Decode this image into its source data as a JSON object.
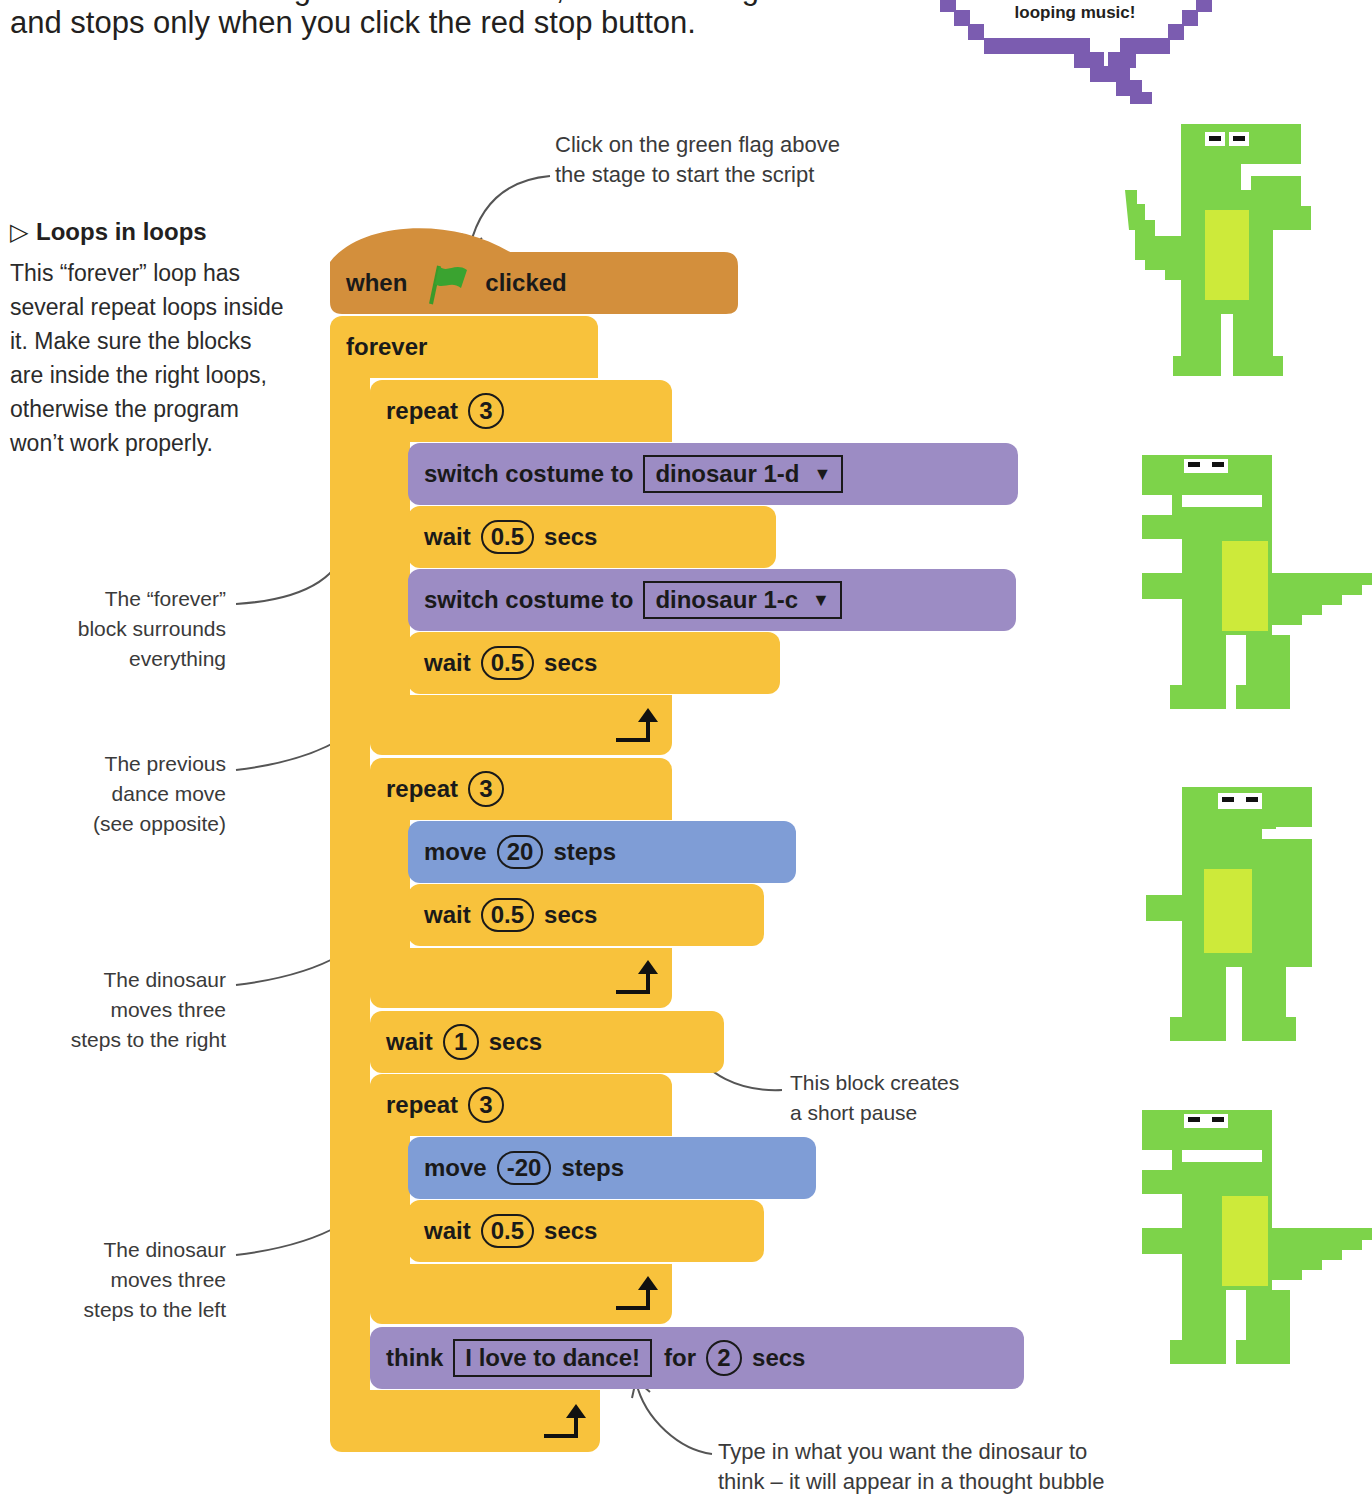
{
  "intro": {
    "line1": "moment. When he’s got his breath back, he dances again",
    "line2": "and stops only when you click the red stop button."
  },
  "speech_bubble": {
    "text": "looping music!",
    "color": "#7b5cb0"
  },
  "sidebar": {
    "title_icon": "triangle-right-icon",
    "title": "Loops in loops",
    "body": "This “forever” loop has several repeat loops inside it. Make sure the blocks are inside the right loops, otherwise the program won’t work properly."
  },
  "annotations": {
    "green_flag": [
      "Click on the green flag above",
      "the stage to start the script"
    ],
    "forever": [
      "The “forever”",
      "block surrounds",
      "everything"
    ],
    "previous": [
      "The previous",
      "dance move",
      "(see opposite)"
    ],
    "right": [
      "The dinosaur",
      "moves three",
      "steps to the right"
    ],
    "left": [
      "The dinosaur",
      "moves three",
      "steps to the left"
    ],
    "pause": [
      "This block creates",
      "a short pause"
    ],
    "think": [
      "Type in what you want the dinosaur to",
      "think – it will appear in a thought bubble"
    ]
  },
  "script": {
    "hat": {
      "pre": "when",
      "icon": "green-flag-icon",
      "post": "clicked"
    },
    "forever": "forever",
    "repeat1": {
      "label": "repeat",
      "count": "3"
    },
    "costume1": {
      "label": "switch costume to",
      "value": "dinosaur 1-d"
    },
    "wait1": {
      "label": "wait",
      "value": "0.5",
      "unit": "secs"
    },
    "costume2": {
      "label": "switch costume to",
      "value": "dinosaur 1-c"
    },
    "wait2": {
      "label": "wait",
      "value": "0.5",
      "unit": "secs"
    },
    "repeat2": {
      "label": "repeat",
      "count": "3"
    },
    "move1": {
      "label": "move",
      "value": "20",
      "unit": "steps"
    },
    "wait3": {
      "label": "wait",
      "value": "0.5",
      "unit": "secs"
    },
    "wait4": {
      "label": "wait",
      "value": "1",
      "unit": "secs"
    },
    "repeat3": {
      "label": "repeat",
      "count": "3"
    },
    "move2": {
      "label": "move",
      "value": "-20",
      "unit": "steps"
    },
    "wait5": {
      "label": "wait",
      "value": "0.5",
      "unit": "secs"
    },
    "think": {
      "label": "think",
      "text": "I love to dance!",
      "for": "for",
      "value": "2",
      "unit": "secs"
    }
  },
  "colors": {
    "events": "#d38f3c",
    "control": "#f8c23c",
    "looks": "#9c8cc4",
    "motion": "#7f9dd6",
    "dino_body": "#7dd34a",
    "dino_belly": "#cdea3a"
  }
}
